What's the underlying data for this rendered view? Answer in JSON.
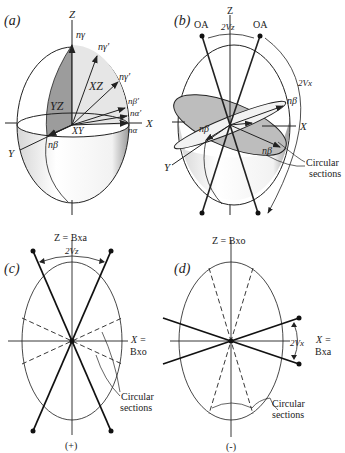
{
  "panels": {
    "a": {
      "label": "(a)",
      "axes": {
        "z": "Z",
        "x": "X",
        "y": "Y"
      },
      "planes": {
        "yz": "YZ",
        "xz": "XZ",
        "xy": "XY"
      },
      "indices": {
        "n_gamma": "nγ",
        "n_gamma_prime_1": "nγ′",
        "n_gamma_prime_2": "nγ′",
        "n_beta_prime": "nβ′",
        "n_alpha_prime": "nα′",
        "n_alpha": "nα",
        "n_beta": "nβ"
      }
    },
    "b": {
      "label": "(b)",
      "axes": {
        "z": "Z",
        "x": "X",
        "y": "Y"
      },
      "optic_axis_left": "OA",
      "optic_axis_right": "OA",
      "angle_top": "2Vz",
      "angle_side": "2Vx",
      "n_beta_labels": [
        "nβ",
        "nβ",
        "nβ"
      ],
      "circular_sections": "Circular sections"
    },
    "c": {
      "label": "(c)",
      "z_axis": "Z = Bxa",
      "x_axis_line1": "X =",
      "x_axis_line2": "Bxo",
      "angle": "2Vz",
      "circular_sections_line1": "Circular",
      "circular_sections_line2": "sections",
      "sign": "(+)"
    },
    "d": {
      "label": "(d)",
      "z_axis": "Z = Bxo",
      "x_axis_line1": "X =",
      "x_axis_line2": "Bxa",
      "angle": "2Vx",
      "circular_sections_line1": "Circular",
      "circular_sections_line2": "sections",
      "sign": "(-)"
    }
  }
}
